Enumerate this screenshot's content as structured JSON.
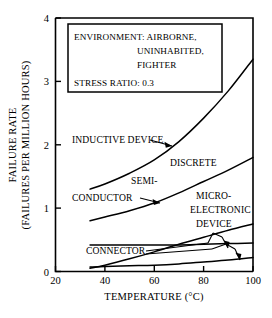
{
  "chart_data": {
    "type": "line",
    "title": "",
    "xlabel": "TEMPERATURE (°C)",
    "ylabel_line1": "FAILURE RATE",
    "ylabel_line2": "(FAILURES PER MILLION HOURS)",
    "xlim": [
      20,
      100
    ],
    "ylim": [
      0,
      4
    ],
    "xticks": [
      20,
      40,
      60,
      80,
      100
    ],
    "yticks": [
      0,
      1,
      2,
      3,
      4
    ],
    "xtick_labels": [
      "20",
      "40",
      "60",
      "80",
      "100"
    ],
    "ytick_labels": [
      "0",
      "1",
      "2",
      "3",
      "4"
    ],
    "grid": false,
    "legend": "none",
    "x": [
      34,
      40,
      50,
      60,
      70,
      80,
      90,
      100
    ],
    "series": [
      {
        "name": "INDUCTIVE DEVICE",
        "values": [
          1.3,
          1.38,
          1.55,
          1.76,
          2.05,
          2.42,
          2.85,
          3.35
        ]
      },
      {
        "name": "DISCRETE SEMI-CONDUCTOR",
        "values": [
          0.8,
          0.86,
          0.96,
          1.08,
          1.24,
          1.42,
          1.6,
          1.8
        ]
      },
      {
        "name": "MICRO-ELECTRONIC DEVICE",
        "values": [
          0.05,
          0.1,
          0.2,
          0.31,
          0.43,
          0.54,
          0.65,
          0.75
        ]
      },
      {
        "name": "CONNECTOR UPPER",
        "values": [
          0.42,
          0.42,
          0.42,
          0.42,
          0.42,
          0.43,
          0.44,
          0.45
        ]
      },
      {
        "name": "CONNECTOR LOWER",
        "values": [
          0.07,
          0.08,
          0.09,
          0.1,
          0.12,
          0.15,
          0.18,
          0.22
        ]
      }
    ],
    "annotations": [
      "INDUCTIVE DEVICE",
      "DISCRETE",
      "SEMI-",
      "CONDUCTOR",
      "MICRO-",
      "ELECTRONIC",
      "DEVICE",
      "CONNECTOR"
    ]
  },
  "info_box": {
    "line1": "ENVIRONMENT:  AIRBORNE,",
    "line2": "UNINHABITED,",
    "line3": "FIGHTER",
    "line4": "STRESS RATIO: 0.3"
  },
  "labels": {
    "inductive_device": "INDUCTIVE DEVICE",
    "discrete": "DISCRETE",
    "semi": "SEMI-",
    "conductor": "CONDUCTOR",
    "micro": "MICRO-",
    "electronic": "ELECTRONIC",
    "device": "DEVICE",
    "connector": "CONNECTOR"
  },
  "axes": {
    "xlabel": "TEMPERATURE (°C)",
    "ylabel_line1": "FAILURE RATE",
    "ylabel_line2": "(FAILURES PER MILLION HOURS)",
    "x0": "20",
    "x1": "40",
    "x2": "60",
    "x3": "80",
    "x4": "100",
    "y0": "0",
    "y1": "1",
    "y2": "2",
    "y3": "3",
    "y4": "4"
  },
  "colors": {
    "ink": "#000000",
    "paper": "#ffffff"
  }
}
